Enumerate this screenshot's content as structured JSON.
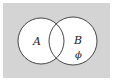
{
  "diagram": {
    "type": "venn",
    "background_color": "#d4d4d4",
    "circle_fill": "#ffffff",
    "stroke_color": "#333333",
    "sets": [
      {
        "label": "A",
        "cx": 41,
        "cy": 41,
        "r": 23
      },
      {
        "label": "B",
        "cx": 73,
        "cy": 41,
        "r": 24
      }
    ],
    "annotations": [
      {
        "text": "ϕ",
        "region": "B only"
      }
    ]
  }
}
